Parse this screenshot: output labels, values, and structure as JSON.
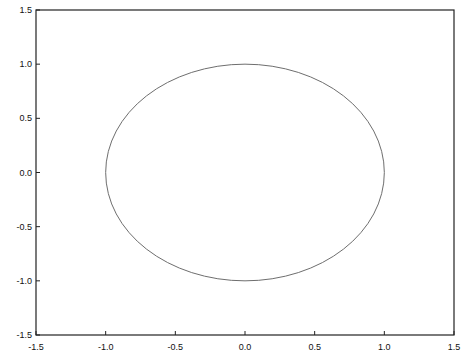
{
  "chart_data": {
    "type": "line",
    "title": "",
    "xlabel": "",
    "ylabel": "",
    "xlim": [
      -1.5,
      1.5
    ],
    "ylim": [
      -1.5,
      1.5
    ],
    "grid": false,
    "legend": null,
    "x_ticks": [
      "-1.5",
      "-1.0",
      "-0.5",
      "0.0",
      "0.5",
      "1.0",
      "1.5"
    ],
    "y_ticks": [
      "-1.5",
      "-1.0",
      "-0.5",
      "0.0",
      "0.5",
      "1.0",
      "1.5"
    ],
    "series": [
      {
        "name": "unit circle",
        "shape": "circle",
        "center": [
          0,
          0
        ],
        "radius": 1.0,
        "color": "#6e6e6e",
        "x": [
          1.0,
          0.866,
          0.5,
          0.0,
          -0.5,
          -0.866,
          -1.0,
          -0.866,
          -0.5,
          0.0,
          0.5,
          0.866,
          1.0
        ],
        "y": [
          0.0,
          0.5,
          0.866,
          1.0,
          0.866,
          0.5,
          0.0,
          -0.5,
          -0.866,
          -1.0,
          -0.866,
          -0.5,
          0.0
        ]
      }
    ]
  }
}
